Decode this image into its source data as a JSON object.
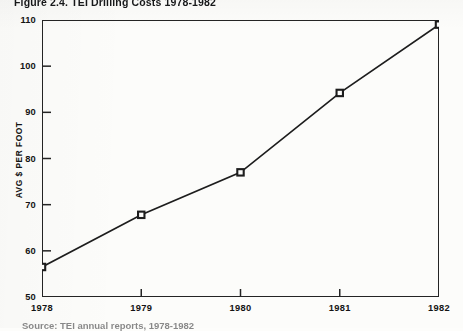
{
  "figure": {
    "title": "Figure 2.4.  TEI Drilling Costs 1978-1982",
    "caption": "Source: TEI annual reports, 1978-1982"
  },
  "chart_data": {
    "type": "line",
    "title": "Figure 2.4.  TEI Drilling Costs 1978-1982",
    "xlabel": "",
    "ylabel": "AVG $ PER FOOT",
    "categories": [
      "1978",
      "1979",
      "1980",
      "1981",
      "1982"
    ],
    "x": [
      1978,
      1979,
      1980,
      1981,
      1982
    ],
    "values": [
      56.5,
      67.8,
      77.0,
      94.2,
      109.0
    ],
    "series": [
      {
        "name": "AVG $ PER FOOT",
        "values": [
          56.5,
          67.8,
          77.0,
          94.2,
          109.0
        ],
        "marker": "square",
        "color": "#1d1d1d"
      }
    ],
    "ylim": [
      50,
      110
    ],
    "xlim": [
      1978,
      1982
    ],
    "yticks": [
      50,
      60,
      70,
      80,
      90,
      100,
      110
    ],
    "ytick_labels": [
      "50",
      "60",
      "70",
      "80",
      "90",
      "100",
      "110"
    ],
    "xticks": [
      1978,
      1979,
      1980,
      1981,
      1982
    ],
    "xtick_labels": [
      "1978",
      "1979",
      "1980",
      "1981",
      "1982"
    ],
    "grid": false,
    "legend": false,
    "legend_position": "none"
  },
  "style": {
    "line_color": "#1d1d1d",
    "frame_color": "#242424",
    "text_color": "#141414",
    "background": "#fcfcfa"
  }
}
